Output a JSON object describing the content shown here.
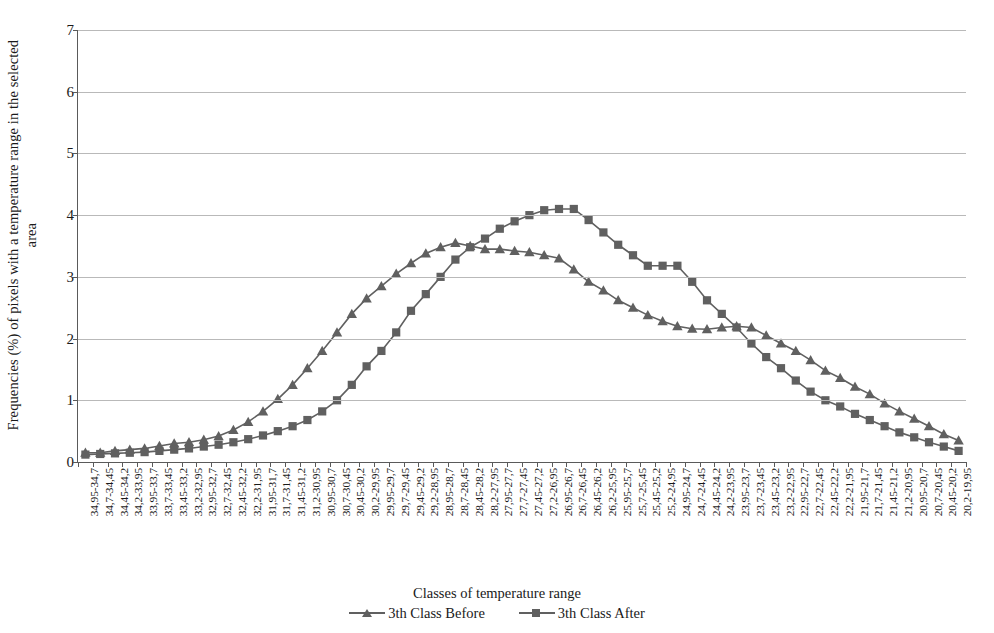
{
  "chart_data": {
    "type": "line",
    "title": "",
    "xlabel": "Classes of temperature range",
    "ylabel_line1": "Frequencies (%) of pixels with a temperature range in the selected",
    "ylabel_line2": "area",
    "ylim": [
      0,
      7
    ],
    "yticks": [
      0,
      1,
      2,
      3,
      4,
      5,
      6,
      7
    ],
    "grid": true,
    "legend_position": "bottom",
    "categories": [
      "34,95-34,7",
      "34,7-34,45",
      "34,45-34,2",
      "34,2-33,95",
      "33,95-33,7",
      "33,7-33,45",
      "33,45-33,2",
      "33,2-32,95",
      "32,95-32,7",
      "32,7-32,45",
      "32,45-32,2",
      "32,2-31,95",
      "31,95-31,7",
      "31,7-31,45",
      "31,45-31,2",
      "31,2-30,95",
      "30,95-30,7",
      "30,7-30,45",
      "30,45-30,2",
      "30,2-29,95",
      "29,95-29,7",
      "29,7-29,45",
      "29,45-29,2",
      "29,2-28,95",
      "28,95-28,7",
      "28,7-28,45",
      "28,45-28,2",
      "28,2-27,95",
      "27,95-27,7",
      "27,7-27,45",
      "27,45-27,2",
      "27,2-26,95",
      "26,95-26,7",
      "26,7-26,45",
      "26,45-26,2",
      "26,2-25,95",
      "25,95-25,7",
      "25,7-25,45",
      "25,45-25,2",
      "25,2-24,95",
      "24,95-24,7",
      "24,7-24,45",
      "24,45-24,2",
      "24,2-23,95",
      "23,95-23,7",
      "23,7-23,45",
      "23,45-23,2",
      "23,2-22,95",
      "22,95-22,7",
      "22,7-22,45",
      "22,45-22,2",
      "22,2-21,95",
      "21,95-21,7",
      "21,7-21,45",
      "21,45-21,2",
      "21,2-20,95",
      "20,95-20,7",
      "20,7-20,45",
      "20,45-20,2",
      "20,2-19,95"
    ],
    "series": [
      {
        "name": "3th Class Before",
        "marker": "triangle",
        "color": "#606060",
        "values": [
          0.15,
          0.15,
          0.18,
          0.2,
          0.22,
          0.26,
          0.3,
          0.32,
          0.36,
          0.42,
          0.52,
          0.65,
          0.82,
          1.02,
          1.25,
          1.52,
          1.8,
          2.1,
          2.4,
          2.65,
          2.85,
          3.05,
          3.22,
          3.38,
          3.48,
          3.55,
          3.5,
          3.45,
          3.45,
          3.42,
          3.4,
          3.35,
          3.3,
          3.12,
          2.92,
          2.78,
          2.62,
          2.5,
          2.38,
          2.28,
          2.2,
          2.16,
          2.15,
          2.18,
          2.2,
          2.18,
          2.05,
          1.92,
          1.8,
          1.65,
          1.48,
          1.36,
          1.22,
          1.1,
          0.95,
          0.82,
          0.7,
          0.58,
          0.45,
          0.35
        ]
      },
      {
        "name": "3th Class After",
        "marker": "square",
        "color": "#606060",
        "values": [
          0.12,
          0.13,
          0.14,
          0.15,
          0.16,
          0.18,
          0.2,
          0.22,
          0.25,
          0.28,
          0.32,
          0.37,
          0.43,
          0.5,
          0.58,
          0.68,
          0.82,
          1.0,
          1.25,
          1.55,
          1.8,
          2.1,
          2.45,
          2.72,
          3.0,
          3.28,
          3.48,
          3.62,
          3.78,
          3.9,
          4.0,
          4.08,
          4.1,
          4.1,
          3.92,
          3.72,
          3.52,
          3.35,
          3.18,
          3.18,
          3.18,
          2.92,
          2.62,
          2.4,
          2.18,
          1.92,
          1.7,
          1.52,
          1.32,
          1.14,
          1.0,
          0.9,
          0.78,
          0.68,
          0.58,
          0.48,
          0.4,
          0.32,
          0.25,
          0.18
        ]
      }
    ]
  },
  "legend": {
    "items": [
      {
        "label": "3th Class Before",
        "marker": "triangle"
      },
      {
        "label": "3th Class After",
        "marker": "square"
      }
    ]
  },
  "colors": {
    "series": "#606060",
    "axis": "#5a5a5a",
    "grid": "#b9b9b9",
    "text": "#1a1a1a"
  }
}
